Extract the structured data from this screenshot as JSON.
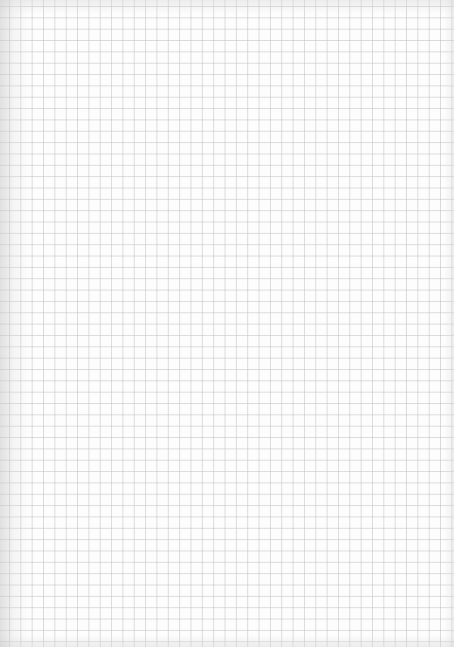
{
  "image": {
    "subject": "blank sheet of grid paper",
    "caption": "Blank graph paper",
    "colors": {
      "paper": "#fdfdfd",
      "grid_line": "#bebebe",
      "edge_shadow": "#c8c8c8"
    },
    "grid": {
      "cell_size_px": 11.35,
      "columns_approx": 40,
      "rows_approx": 57
    }
  }
}
